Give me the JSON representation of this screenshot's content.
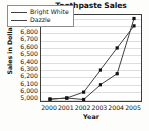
{
  "chart_data": {
    "type": "line",
    "title": "Toothpaste Sales",
    "xlabel": "Year",
    "ylabel": "Sales in Dollars",
    "categories": [
      "2000",
      "2001",
      "2002",
      "2003",
      "2004",
      "2005"
    ],
    "x": [
      2000,
      2001,
      2002,
      2003,
      2004,
      2005
    ],
    "ytick_labels": [
      "10,000",
      "6,900",
      "6,800",
      "6,700",
      "6,600",
      "6,500",
      "6,400",
      "6,300",
      "6,200",
      "6,100",
      "6,000",
      "5,000"
    ],
    "ytick_values": [
      10000,
      6900,
      6800,
      6700,
      6600,
      6500,
      6400,
      6300,
      6200,
      6100,
      6000,
      5000
    ],
    "grid": true,
    "legend_position": "top-left",
    "series": [
      {
        "name": "Bright White",
        "color": "#404040",
        "marker": "square",
        "values": [
          5050,
          5200,
          6000,
          6300,
          6600,
          6900
        ],
        "value_labels": [
          "5,050",
          "5,200",
          "6,000",
          "6,300",
          "6,600",
          "6,900"
        ]
      },
      {
        "name": "Dazzle",
        "color": "#404040",
        "marker": "square",
        "values": [
          5050,
          5200,
          5000,
          6100,
          6250,
          10000
        ],
        "value_labels": [
          "5,050",
          "5,200",
          "5,000",
          "6,100",
          "6,250",
          "10,000"
        ]
      }
    ]
  }
}
